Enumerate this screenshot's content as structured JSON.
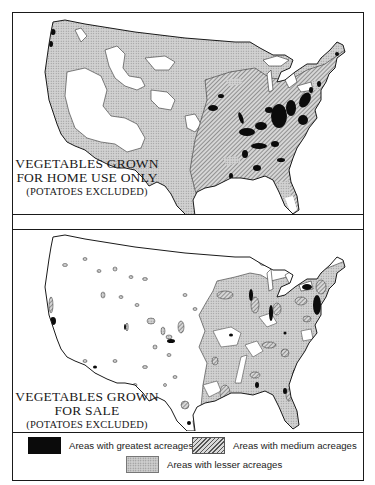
{
  "maps": [
    {
      "id": "home-use",
      "title_line1": "VEGETABLES GROWN",
      "title_line2": "FOR HOME USE ONLY",
      "title_line3": "(POTATOES EXCLUDED)"
    },
    {
      "id": "for-sale",
      "title_line1": "VEGETABLES GROWN",
      "title_line2": "FOR SALE",
      "title_line3": "(POTATOES EXCLUDED)"
    }
  ],
  "legend": {
    "items": [
      {
        "key": "greatest",
        "label": "Areas with greatest acreages",
        "fill": "solid-black",
        "color": "#0b0b0b"
      },
      {
        "key": "medium",
        "label": "Areas with medium acreages",
        "fill": "diagonal-hatch",
        "color": "#555555"
      },
      {
        "key": "lesser",
        "label": "Areas with lesser acreages",
        "fill": "stipple",
        "color": "#cfcfcf"
      }
    ]
  },
  "colors": {
    "border": "#1a1a1a",
    "background": "#ffffff",
    "greatest": "#0b0b0b",
    "lesser_base": "#cfcfcf"
  }
}
